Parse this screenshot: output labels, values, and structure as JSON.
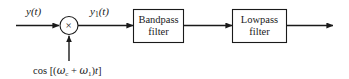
{
  "diagram": {
    "type": "signal-flow-block-diagram",
    "background_color": "#ffffff",
    "line_color": "#1a1a1a",
    "text_color": "#1a1a1a",
    "input_signal_label": "y(t)",
    "intermediate_signal_label_base": "y",
    "intermediate_signal_label_sub": "1",
    "intermediate_signal_label_tail": "(t)",
    "multiplier_symbol": "×",
    "oscillator": {
      "function": "cos",
      "open_bracket": "[(",
      "omega_1": "ω",
      "omega_1_sub": "c",
      "plus": "+",
      "omega_2": "ω",
      "omega_2_sub": "1",
      "close_paren": ")",
      "time_var": "t",
      "close_bracket": "]",
      "full_text": "cos [(ωc + ω1)t]"
    },
    "blocks": [
      {
        "name": "bandpass-filter",
        "line1": "Bandpass",
        "line2": "filter"
      },
      {
        "name": "lowpass-filter",
        "line1": "Lowpass",
        "line2": "filter"
      }
    ]
  }
}
